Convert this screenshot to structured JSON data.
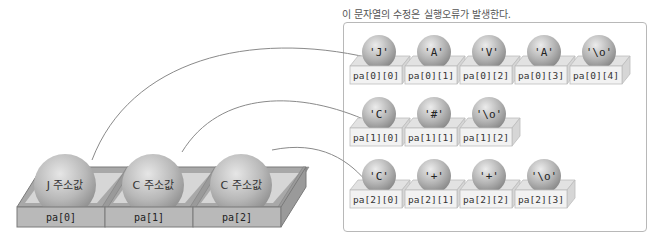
{
  "caption": "이 문자열의 수정은 실행오류가 발생한다.",
  "pointer_array": {
    "cells": [
      {
        "label": "pa[0]",
        "ball": "J 주소값"
      },
      {
        "label": "pa[1]",
        "ball": "C 주소값"
      },
      {
        "label": "pa[2]",
        "ball": "C 주소값"
      }
    ]
  },
  "strings": [
    {
      "row": 0,
      "cells": [
        {
          "char": "'J'",
          "label": "pa[0][0]"
        },
        {
          "char": "'A'",
          "label": "pa[0][1]"
        },
        {
          "char": "'V'",
          "label": "pa[0][2]"
        },
        {
          "char": "'A'",
          "label": "pa[0][3]"
        },
        {
          "char": "'\\o'",
          "label": "pa[0][4]"
        }
      ]
    },
    {
      "row": 1,
      "cells": [
        {
          "char": "'C'",
          "label": "pa[1][0]"
        },
        {
          "char": "'#'",
          "label": "pa[1][1]"
        },
        {
          "char": "'\\o'",
          "label": "pa[1][2]"
        }
      ]
    },
    {
      "row": 2,
      "cells": [
        {
          "char": "'C'",
          "label": "pa[2][0]"
        },
        {
          "char": "'+'",
          "label": "pa[2][1]"
        },
        {
          "char": "'+'",
          "label": "pa[2][2]"
        },
        {
          "char": "'\\o'",
          "label": "pa[2][3]"
        }
      ]
    }
  ],
  "colors": {
    "ball_light": "#e4e4e4",
    "ball_dark": "#8f8f8f",
    "box_front": "#f0f0f0",
    "box_side": "#d8d8d8",
    "tray": "#b0b0b0",
    "tray_dark": "#8a8a8a",
    "arrow": "#888888"
  }
}
